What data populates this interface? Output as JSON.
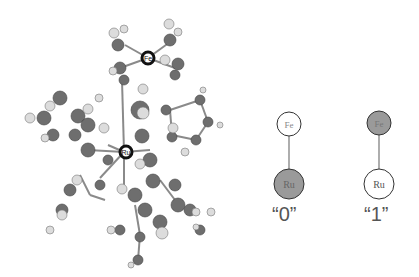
{
  "figure": {
    "molecule": {
      "metal_labels": {
        "top": "Fe",
        "center": "Ru"
      }
    },
    "states": [
      {
        "label": "“0”",
        "top_atom": "Fe",
        "bottom_atom": "Ru",
        "filled": "bottom"
      },
      {
        "label": "“1”",
        "top_atom": "Fe",
        "bottom_atom": "Ru",
        "filled": "top"
      }
    ],
    "colors": {
      "atom_dark": "#6e6e6e",
      "atom_light": "#dcdcdc",
      "bond": "#888888",
      "filled_state": "#9a9a9a",
      "outline": "#333333"
    }
  }
}
